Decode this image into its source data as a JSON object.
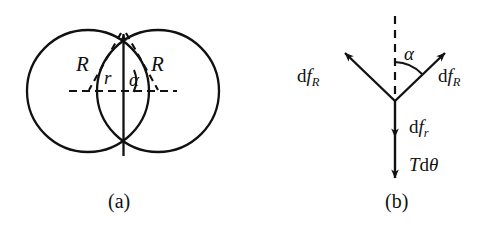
{
  "figure": {
    "background_color": "#ffffff",
    "stroke_color": "#111111",
    "panels": [
      {
        "id": "a",
        "caption": "(a)",
        "type": "geometry-diagram",
        "description": "Two equal circles of radius R overlapping; dashed radii from upper intersection point to the two centers, dashed center line, solid vertical chord through both intersection points, angle alpha at the right center.",
        "circles": [
          {
            "name": "left-circle",
            "cx": 88,
            "cy": 91,
            "r": 61,
            "radius_label": "R"
          },
          {
            "name": "right-circle",
            "cx": 158,
            "cy": 91,
            "r": 61,
            "radius_label": "R"
          }
        ],
        "vertical_chord": {
          "x": 123,
          "y_top": 29,
          "y_bottom": 156,
          "style": "solid",
          "arrow_at_top": true
        },
        "center_line": {
          "x_start": 70,
          "x_end": 176,
          "y": 91,
          "style": "dashed"
        },
        "radius_lines": [
          {
            "from": "upper-intersection",
            "to": "left-center",
            "style": "dashed",
            "label": "R"
          },
          {
            "from": "upper-intersection",
            "to": "right-center",
            "style": "dashed",
            "label": "R"
          }
        ],
        "angle": {
          "label": "α",
          "vertex": "right-center",
          "arc_radius": 25
        },
        "labels": {
          "R_left": "R",
          "R_right": "R",
          "r": "r",
          "alpha": "α"
        }
      },
      {
        "id": "b",
        "caption": "(b)",
        "type": "force-vector-diagram",
        "description": "Free-body diagram at the vertex: two symmetric upward-slanting force vectors df_R, a downward vector df_r, and a longer downward vector T d-theta. A vertical dashed reference line marks the symmetry axis; alpha is the angle between the axis and the right df_R vector.",
        "vertex": {
          "x": 395,
          "y": 101
        },
        "dashed_axis": {
          "x": 395,
          "y_top": 16,
          "y_bottom": 101,
          "style": "dashed"
        },
        "vectors": [
          {
            "name": "df-R-left",
            "label_upright": "d",
            "label_italic": "f",
            "label_sub": "R",
            "direction": "up-left",
            "angle_from_axis_deg": 42,
            "length": 72
          },
          {
            "name": "df-R-right",
            "label_upright": "d",
            "label_italic": "f",
            "label_sub": "R",
            "direction": "up-right",
            "angle_from_axis_deg": 42,
            "length": 72
          },
          {
            "name": "df-r",
            "label_upright": "d",
            "label_italic": "f",
            "label_sub": "r",
            "direction": "down",
            "angle_from_axis_deg": 180,
            "length": 39
          },
          {
            "name": "T-d-theta",
            "label_italic": "T",
            "label_upright": "d",
            "label_greek": "θ",
            "direction": "down",
            "angle_from_axis_deg": 180,
            "length": 78
          }
        ],
        "angle": {
          "label": "α",
          "vertex": "force-vertex",
          "arc_radius": 38
        },
        "labels": {
          "dfR_left_upright": "d",
          "dfR_left_italic": "f",
          "dfR_left_sub": "R",
          "dfR_right_upright": "d",
          "dfR_right_italic": "f",
          "dfR_right_sub": "R",
          "dfr_upright": "d",
          "dfr_italic": "f",
          "dfr_sub": "r",
          "Tdtheta_T": "T",
          "Tdtheta_d": "d",
          "Tdtheta_theta": "θ",
          "alpha": "α"
        }
      }
    ]
  }
}
